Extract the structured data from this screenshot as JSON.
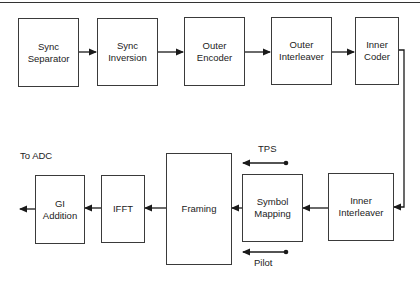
{
  "diagram": {
    "type": "block-diagram",
    "top_row": [
      {
        "id": "sync-separator",
        "label": "Sync\nSeparator"
      },
      {
        "id": "sync-inversion",
        "label": "Sync\nInversion"
      },
      {
        "id": "outer-encoder",
        "label": "Outer\nEncoder"
      },
      {
        "id": "outer-interleaver",
        "label": "Outer\nInterleaver"
      },
      {
        "id": "inner-coder",
        "label": "Inner\nCoder"
      }
    ],
    "bottom_row": [
      {
        "id": "gi-addition",
        "label": "GI\nAddition"
      },
      {
        "id": "ifft",
        "label": "IFFT"
      },
      {
        "id": "framing",
        "label": "Framing"
      },
      {
        "id": "symbol-mapping",
        "label": "Symbol\nMapping"
      },
      {
        "id": "inner-interleaver",
        "label": "Inner\nInterleaver"
      }
    ],
    "annotations": {
      "output": "To ADC",
      "tps": "TPS",
      "pilot": "Pilot"
    },
    "flow": [
      "Sync Separator -> Sync Inversion",
      "Sync Inversion -> Outer Encoder",
      "Outer Encoder -> Outer Interleaver",
      "Outer Interleaver -> Inner Coder",
      "Inner Coder -> Inner Interleaver",
      "Inner Interleaver -> Symbol Mapping",
      "TPS -> Symbol Mapping",
      "Pilot -> Symbol Mapping",
      "Symbol Mapping -> Framing",
      "Framing -> IFFT",
      "IFFT -> GI Addition",
      "GI Addition -> To ADC"
    ]
  }
}
